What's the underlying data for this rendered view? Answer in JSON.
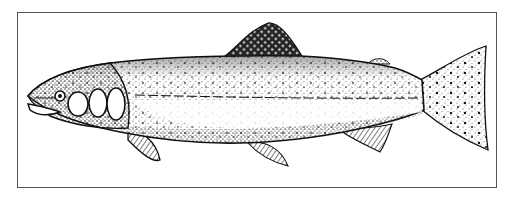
{
  "figure": {
    "subject": "Trout",
    "style": "black-and-white stipple line illustration",
    "colors": {
      "ink": "#111111",
      "paper": "#ffffff",
      "frame": "#555555"
    }
  }
}
